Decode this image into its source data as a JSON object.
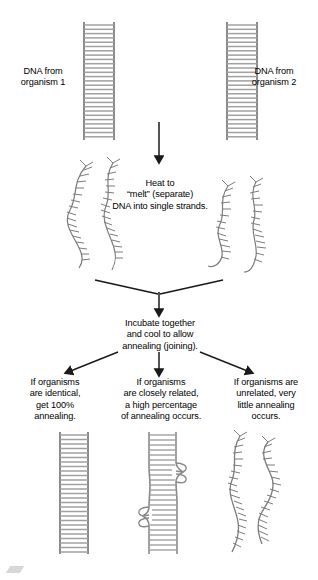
{
  "figure": {
    "colors": {
      "rail": "#8a8a8a",
      "rung": "#a8a8a8",
      "strand": "#7c7c7c",
      "arrow": "#1a1a1a",
      "text": "#000000",
      "background": "#ffffff"
    }
  },
  "top_labels": {
    "left": "DNA from\norganism 1",
    "right": "DNA from\norganism 2"
  },
  "steps": [
    {
      "id": "melt",
      "caption": "Heat to\n“melt” (separate)\nDNA into single strands."
    },
    {
      "id": "anneal",
      "caption": "Incubate together\nand cool to allow\nannealing (joining)."
    }
  ],
  "results": [
    {
      "id": "identical",
      "caption": "If organisms\nare identical,\nget 100%\nannealing.",
      "structure": "full-duplex-ladder"
    },
    {
      "id": "closely-related",
      "caption": "If organisms\nare closely related,\na high percentage\nof annealing occurs.",
      "structure": "ladder-with-mismatch-bulges"
    },
    {
      "id": "unrelated",
      "caption": "If organisms are\nunrelated, very\nlittle annealing\noccurs.",
      "structure": "mostly-single-strands"
    }
  ],
  "icons": {
    "dna_ladder": "dna-ladder-icon",
    "single_strand": "dna-single-strand-icon",
    "arrow_down": "arrow-down-icon",
    "arrow_branch": "arrow-branch-icon"
  }
}
